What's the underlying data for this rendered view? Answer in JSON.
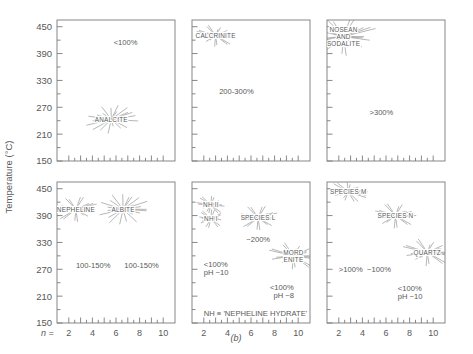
{
  "figure": {
    "caption": "(b)",
    "ylabel": "Temperature (°C)",
    "xlabel_prefix": "n =",
    "ytick_labels": [
      "450",
      "390",
      "330",
      "270",
      "210",
      "150"
    ],
    "xtick_labels": [
      "2",
      "4",
      "6",
      "8",
      "10"
    ],
    "line_color": "#7a7a7a",
    "text_color": "#585858",
    "background": "#ffffff"
  },
  "chart_data": {
    "type": "scatter",
    "title": "",
    "subtitle": "",
    "xlabel": "n",
    "ylabel": "Temperature (°C)",
    "xlim": [
      1,
      11
    ],
    "ylim": [
      150,
      465
    ],
    "xticks": [
      2,
      3,
      4,
      5,
      6,
      7,
      8,
      9,
      10
    ],
    "xtick_labels": [
      "2",
      "",
      "4",
      "",
      "6",
      "",
      "8",
      "",
      "10"
    ],
    "yticks": [
      150,
      180,
      210,
      240,
      270,
      300,
      330,
      360,
      390,
      420,
      450
    ],
    "ytick_labels": [
      "150",
      "",
      "210",
      "",
      "270",
      "",
      "330",
      "",
      "390",
      "",
      "450"
    ],
    "grid": false,
    "legend": false,
    "marker": "starburst",
    "panel_layout": {
      "rows": 2,
      "cols": 3
    },
    "panels": [
      {
        "id": "panel-analcite",
        "row": 0,
        "col": 0,
        "clusters": [
          {
            "label": "ANALCITE",
            "x": 5.6,
            "y": 243,
            "rays": 22,
            "radius": 0.72
          }
        ],
        "annotations": [
          {
            "text": "<100%",
            "x": 5.8,
            "y": 410
          }
        ]
      },
      {
        "id": "panel-calcrinite",
        "row": 0,
        "col": 1,
        "clusters": [
          {
            "label": "CALCRINITE",
            "x": 3.0,
            "y": 430,
            "rays": 20,
            "radius": 0.55
          }
        ],
        "annotations": [
          {
            "text": "200-300%",
            "x": 3.3,
            "y": 300
          }
        ]
      },
      {
        "id": "panel-nosean-sodalite",
        "row": 0,
        "col": 2,
        "clusters": [
          {
            "label": "NOSEAN AND SODALITE",
            "label_lines": [
              "NOSEAN",
              "AND",
              "SODALITE"
            ],
            "x": 2.4,
            "y": 428,
            "rays": 20,
            "radius": 0.95
          }
        ],
        "annotations": [
          {
            "text": ">300%",
            "x": 4.6,
            "y": 252
          }
        ]
      },
      {
        "id": "panel-nepheline-albite",
        "row": 1,
        "col": 0,
        "clusters": [
          {
            "label": "NEPHELINE",
            "x": 2.6,
            "y": 404,
            "rays": 20,
            "radius": 0.62
          },
          {
            "label": "ALBITE",
            "x": 6.6,
            "y": 404,
            "rays": 22,
            "radius": 0.75
          }
        ],
        "annotations": [
          {
            "text": "100-150%",
            "x": 2.6,
            "y": 272
          },
          {
            "text": "100-150%",
            "x": 6.7,
            "y": 272
          }
        ]
      },
      {
        "id": "panel-nepheline-hydrate",
        "row": 1,
        "col": 1,
        "clusters": [
          {
            "label": "NH II",
            "x": 2.6,
            "y": 414,
            "rays": 16,
            "radius": 0.45
          },
          {
            "label": "NH I",
            "x": 2.6,
            "y": 383,
            "rays": 16,
            "radius": 0.45
          },
          {
            "label": "SPECIES L",
            "x": 6.6,
            "y": 385,
            "rays": 20,
            "radius": 0.6
          },
          {
            "label": "MORDENITE",
            "label_lines": [
              "MORD",
              "ENITE"
            ],
            "x": 9.6,
            "y": 300,
            "rays": 20,
            "radius": 0.7
          }
        ],
        "annotations": [
          {
            "text": "~200%",
            "x": 5.6,
            "y": 330
          },
          {
            "text": "<100%",
            "x": 2.0,
            "y": 275
          },
          {
            "text": "pH ~10",
            "x": 2.0,
            "y": 258
          },
          {
            "text": "<100%",
            "x": 7.6,
            "y": 224
          },
          {
            "text": "pH ~8",
            "x": 7.9,
            "y": 205
          },
          {
            "text": "NH ≡ 'NEPHELINE HYDRATE'",
            "x": 2.0,
            "y": 166
          }
        ]
      },
      {
        "id": "panel-species-quartz",
        "row": 1,
        "col": 2,
        "clusters": [
          {
            "label": "SPECIES M",
            "x": 2.8,
            "y": 443,
            "rays": 18,
            "radius": 0.55
          },
          {
            "label": "SPECIES N",
            "x": 6.8,
            "y": 390,
            "rays": 20,
            "radius": 0.62
          },
          {
            "label": "QUARTZ",
            "x": 9.5,
            "y": 308,
            "rays": 20,
            "radius": 0.7
          }
        ],
        "annotations": [
          {
            "text": ">100%",
            "x": 2.0,
            "y": 263
          },
          {
            "text": "~100%",
            "x": 4.4,
            "y": 263
          },
          {
            "text": "<100%",
            "x": 7.0,
            "y": 222
          },
          {
            "text": "pH ~10",
            "x": 7.0,
            "y": 203
          }
        ]
      }
    ]
  }
}
